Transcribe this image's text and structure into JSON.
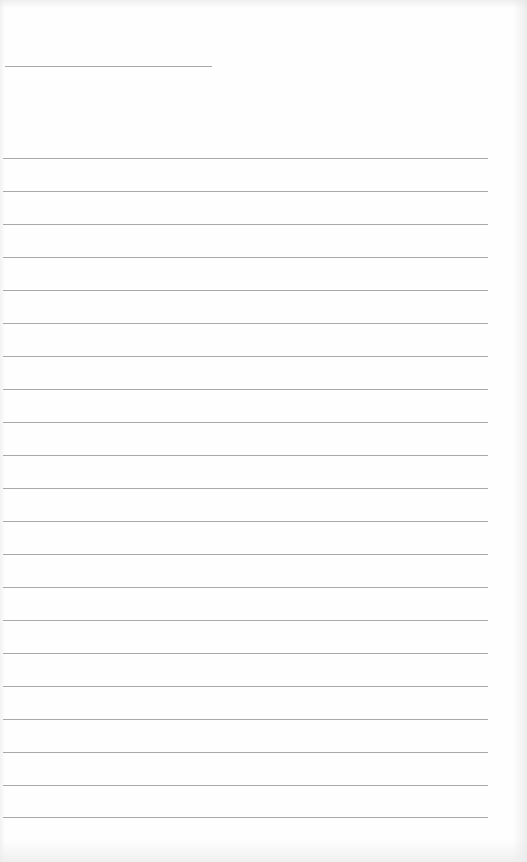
{
  "document": {
    "type": "lined-paper",
    "colors": {
      "paper": "#fefefe",
      "rule": "#a9a9a9"
    },
    "header_rule": {
      "x": 5,
      "y": 66,
      "width": 207
    },
    "body_rules": {
      "x": 3,
      "width": 485,
      "y_positions": [
        158,
        191,
        224,
        257,
        290,
        323,
        356,
        389,
        422,
        455,
        488,
        521,
        554,
        587,
        620,
        653,
        686,
        719,
        752,
        785,
        817
      ]
    }
  }
}
